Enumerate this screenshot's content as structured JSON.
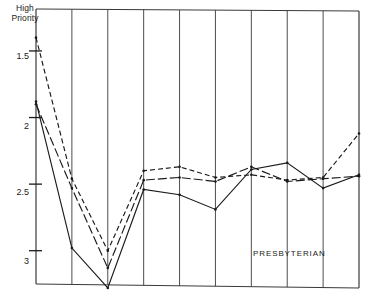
{
  "chart_data": {
    "type": "line",
    "title": "",
    "subtitle": "",
    "xlabel": "",
    "ylabel": "High Priority",
    "ylabel_lines": [
      "High",
      "Priority"
    ],
    "grid": "vertical",
    "legend_position": "none",
    "y_axis_inverted": true,
    "ylim": [
      3.3,
      1.25
    ],
    "y_ticks": [
      1.5,
      2,
      2.5,
      3
    ],
    "y_tick_labels": [
      "1.5",
      "2",
      "2.5",
      "3"
    ],
    "x": [
      1,
      2,
      3,
      4,
      5,
      6,
      7,
      8,
      9,
      10
    ],
    "categories": [
      "1",
      "2",
      "3",
      "4",
      "5",
      "6",
      "7",
      "8",
      "9",
      "10"
    ],
    "annotations": [
      {
        "text": "PRESBYTERIAN",
        "x": 8.0,
        "y": 2.92
      }
    ],
    "series": [
      {
        "name": "series-1",
        "style": "solid",
        "color": "#1a1a1a",
        "values": [
          2.62,
          1.52,
          1.22,
          1.96,
          1.92,
          1.81,
          2.11,
          2.16,
          1.97,
          2.07
        ]
      },
      {
        "name": "series-2",
        "style": "dash-dot",
        "color": "#1a1a1a",
        "values": [
          2.6,
          1.97,
          1.37,
          2.03,
          2.05,
          2.02,
          2.13,
          2.02,
          2.04,
          2.06
        ]
      },
      {
        "name": "series-3",
        "style": "dashed",
        "color": "#1a1a1a",
        "values": [
          3.1,
          2.04,
          1.5,
          2.1,
          2.13,
          2.05,
          2.07,
          2.03,
          2.05,
          2.38
        ]
      }
    ]
  },
  "axis": {
    "y_title_line1": "High",
    "y_title_line2": "Priority",
    "tick_1": "1.5",
    "tick_2": "2",
    "tick_3": "2.5",
    "tick_4": "3"
  },
  "annotation": {
    "presbyterian": "PRESBYTERIAN"
  },
  "caption": {
    "text": ""
  }
}
